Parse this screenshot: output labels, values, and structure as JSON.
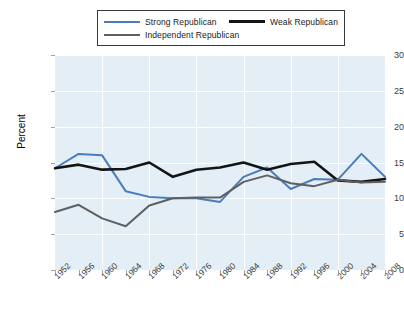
{
  "chart_data": {
    "type": "line",
    "title": "",
    "xlabel": "",
    "ylabel": "Percent",
    "xlim": [
      1952,
      2008
    ],
    "ylim": [
      0,
      30
    ],
    "yticks": [
      0,
      5,
      10,
      15,
      20,
      25,
      30
    ],
    "grid": true,
    "legend_position": "top",
    "categories": [
      "1952",
      "1956",
      "1960",
      "1964",
      "1968",
      "1972",
      "1976",
      "1980",
      "1984",
      "1988",
      "1992",
      "1996",
      "2000",
      "2004",
      "2008"
    ],
    "series": [
      {
        "name": "Strong Republican",
        "color": "#4a7ebb",
        "values": [
          14.2,
          16.2,
          16.0,
          11.0,
          10.2,
          10.0,
          10.0,
          9.5,
          13.0,
          14.3,
          11.3,
          12.7,
          12.6,
          16.2,
          13.0
        ]
      },
      {
        "name": "Weak Republican",
        "color": "#141414",
        "values": [
          14.2,
          14.7,
          14.0,
          14.1,
          15.0,
          13.0,
          14.0,
          14.3,
          15.0,
          14.0,
          14.8,
          15.1,
          12.5,
          12.3,
          12.7
        ]
      },
      {
        "name": "Independent Republican",
        "color": "#5f5f5f",
        "values": [
          8.1,
          9.1,
          7.2,
          6.1,
          9.0,
          10.0,
          10.1,
          10.1,
          12.3,
          13.2,
          12.1,
          11.7,
          12.6,
          12.2,
          12.3
        ]
      }
    ]
  },
  "legend": {
    "entries": [
      {
        "label": "Strong Republican"
      },
      {
        "label": "Weak Republican"
      },
      {
        "label": "Independent Republican"
      }
    ]
  }
}
